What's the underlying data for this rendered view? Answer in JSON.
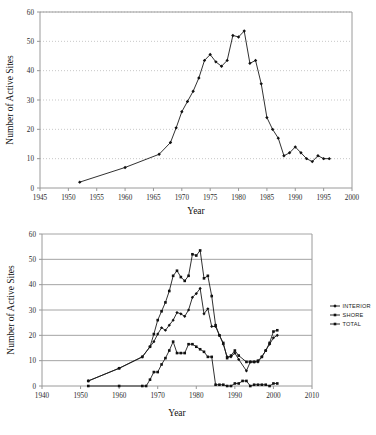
{
  "figure_top": {
    "ylabel": "Number of Active Sites",
    "xlabel": "Year"
  },
  "figure_bottom": {
    "ylabel": "Number of Active Sites",
    "xlabel": "Year"
  },
  "chart_data": [
    {
      "type": "line",
      "title": "",
      "xlabel": "Year",
      "ylabel": "Number of Active Sites",
      "xlim": [
        1945,
        2000
      ],
      "ylim": [
        0,
        60
      ],
      "xticks": [
        1945,
        1950,
        1955,
        1960,
        1965,
        1970,
        1975,
        1980,
        1985,
        1990,
        1995,
        2000
      ],
      "yticks": [
        0,
        10,
        20,
        30,
        40,
        50,
        60
      ],
      "grid": "horizontal-dotted",
      "legend": "none",
      "marker": "filled-diamond",
      "series": [
        {
          "name": "TOTAL",
          "x": [
            1952,
            1960,
            1966,
            1968,
            1969,
            1970,
            1971,
            1972,
            1973,
            1974,
            1975,
            1976,
            1977,
            1978,
            1979,
            1980,
            1981,
            1982,
            1983,
            1984,
            1985,
            1986,
            1987,
            1988,
            1989,
            1990,
            1991,
            1992,
            1993,
            1994,
            1995,
            1996
          ],
          "values": [
            2,
            7,
            11.5,
            15.5,
            20.5,
            26,
            29.5,
            33,
            37.5,
            43.5,
            45.5,
            43,
            41.5,
            43.5,
            52,
            51.5,
            53.5,
            42.5,
            43.5,
            35.5,
            24,
            20,
            17,
            11,
            12,
            14,
            12,
            10,
            9,
            11,
            10,
            10
          ]
        }
      ]
    },
    {
      "type": "line",
      "title": "",
      "xlabel": "Year",
      "ylabel": "Number of Active Sites",
      "xlim": [
        1940,
        2010
      ],
      "ylim": [
        0,
        60
      ],
      "xticks": [
        1940,
        1950,
        1960,
        1970,
        1980,
        1990,
        2000,
        2010
      ],
      "yticks": [
        0,
        10,
        20,
        30,
        40,
        50,
        60
      ],
      "grid": "horizontal-solid",
      "legend": "right",
      "series": [
        {
          "name": "INTERIOR",
          "marker": "filled-diamond",
          "x": [
            1952,
            1960,
            1966,
            1968,
            1969,
            1970,
            1971,
            1972,
            1973,
            1974,
            1975,
            1976,
            1977,
            1978,
            1979,
            1980,
            1981,
            1982,
            1983,
            1984,
            1985,
            1986,
            1987,
            1988,
            1989,
            1990,
            1991,
            1993,
            1994,
            1995,
            1996,
            1997,
            1998,
            1999,
            2000,
            2001
          ],
          "values": [
            2,
            7,
            11.5,
            15.5,
            17.5,
            20.5,
            23,
            22,
            24,
            26,
            29,
            28.5,
            27.5,
            30,
            35,
            36.5,
            38.5,
            28.5,
            30.5,
            23.5,
            23.5,
            20,
            16.5,
            11.5,
            11.5,
            13,
            10.5,
            6,
            9.5,
            9.5,
            9.5,
            11.5,
            14,
            16.5,
            19,
            20
          ]
        },
        {
          "name": "SHORE",
          "marker": "filled-square",
          "x": [
            1952,
            1960,
            1966,
            1967,
            1968,
            1969,
            1970,
            1971,
            1972,
            1973,
            1974,
            1975,
            1976,
            1977,
            1978,
            1979,
            1980,
            1981,
            1982,
            1983,
            1984,
            1985,
            1986,
            1987,
            1988,
            1989,
            1990,
            1991,
            1992,
            1993,
            1994,
            1995,
            1996,
            1997,
            1998,
            1999,
            2000,
            2001
          ],
          "values": [
            0,
            0,
            0,
            0,
            2.5,
            5.5,
            5.5,
            8.5,
            11,
            14,
            17.5,
            13,
            13,
            13,
            16.5,
            16.5,
            15.5,
            14.5,
            13.5,
            11.5,
            11.5,
            0.5,
            0.5,
            0.5,
            0,
            0,
            1,
            1,
            2,
            2,
            0,
            0.5,
            0.5,
            0.5,
            0.5,
            0,
            1,
            1
          ]
        },
        {
          "name": "TOTAL",
          "marker": "filled-square",
          "x": [
            1952,
            1960,
            1966,
            1968,
            1969,
            1970,
            1971,
            1972,
            1973,
            1974,
            1975,
            1976,
            1977,
            1978,
            1979,
            1980,
            1981,
            1982,
            1983,
            1984,
            1985,
            1986,
            1987,
            1988,
            1989,
            1990,
            1991,
            1993,
            1994,
            1995,
            1996,
            1997,
            1998,
            1999,
            2000,
            2001
          ],
          "values": [
            2,
            7,
            11.5,
            15.5,
            20.5,
            26,
            29.5,
            33,
            37.5,
            43.5,
            45.5,
            43,
            41.5,
            43.5,
            52,
            51.5,
            53.5,
            42.5,
            43.5,
            35.5,
            24,
            20,
            17,
            11,
            12,
            14,
            12,
            9.5,
            9.5,
            9.5,
            10,
            11.5,
            14,
            17,
            21.5,
            22
          ]
        }
      ],
      "legend_items": [
        {
          "label": "INTERIOR"
        },
        {
          "label": "SHORE"
        },
        {
          "label": "TOTAL"
        }
      ]
    }
  ]
}
